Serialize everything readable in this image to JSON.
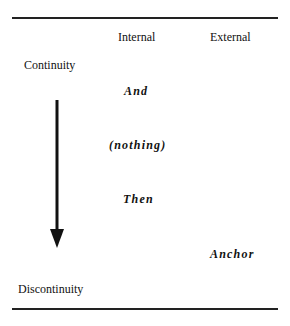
{
  "table": {
    "columns": [
      "Internal",
      "External"
    ],
    "rows": {
      "top_label": "Continuity",
      "bottom_label": "Discontinuity"
    },
    "entries": [
      {
        "text": "And",
        "column": "Internal"
      },
      {
        "text": "(nothing)",
        "column": "Internal"
      },
      {
        "text": "Then",
        "column": "Internal"
      },
      {
        "text": "Anchor",
        "column": "External"
      }
    ]
  },
  "arrow": {
    "direction": "down",
    "from": "Continuity",
    "to": "Discontinuity"
  }
}
